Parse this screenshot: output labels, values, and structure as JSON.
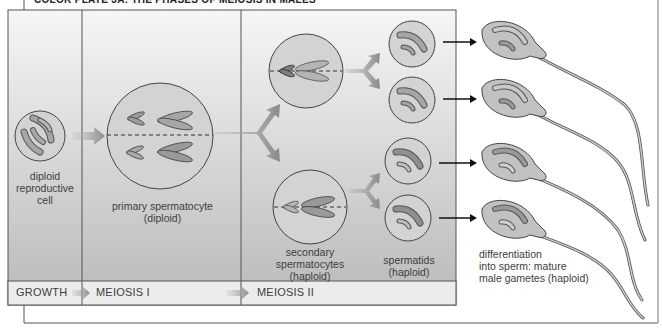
{
  "figure": {
    "title": "COLOR PLATE 3A: THE PHASES OF MEIOSIS IN MALES",
    "colors": {
      "panel_top": "#f4f4f4",
      "panel_bottom": "#bdbdbd",
      "cell_fill": "#d4d4d4",
      "chromosome_fill": "#a9a9a9",
      "chromosome_stroke": "#4a4a4a",
      "arrow_gray": "#8c8c8c",
      "frame": "#555555",
      "stage_bar": "#ededed"
    }
  },
  "cells": {
    "diploid": {
      "label_lines": [
        "diploid",
        "reproductive",
        "cell"
      ]
    },
    "primary": {
      "label_lines": [
        "primary spermatocyte",
        "(diploid)"
      ]
    },
    "secondary": {
      "label_lines": [
        "secondary",
        "spermatocytes",
        "(haploid)"
      ]
    },
    "spermatids": {
      "label_lines": [
        "spermatids",
        "(haploid)"
      ]
    },
    "sperm": {
      "label_lines": [
        "differentiation",
        "into sperm: mature",
        "male gametes (haploid)"
      ]
    }
  },
  "stages": [
    {
      "label": "GROWTH"
    },
    {
      "label": "MEIOSIS I"
    },
    {
      "label": "MEIOSIS II"
    }
  ]
}
